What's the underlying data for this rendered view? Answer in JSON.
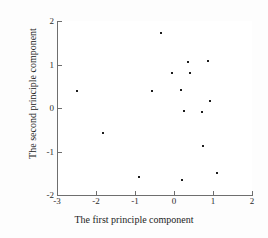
{
  "chart_data": {
    "type": "scatter",
    "title": "",
    "xlabel": "The first principle component",
    "ylabel": "The second principle component",
    "xlim": [
      -3,
      2
    ],
    "ylim": [
      -2,
      2
    ],
    "xticks": [
      "-3",
      "-2",
      "-1",
      "0",
      "1",
      "2"
    ],
    "xtick_values": [
      -3,
      -2,
      -1,
      0,
      1,
      2
    ],
    "yticks": [
      "2",
      "1",
      "0",
      "-1",
      "-2"
    ],
    "ytick_values": [
      2,
      1,
      0,
      -1,
      -2
    ],
    "grid": false,
    "legend": null,
    "marker": "dot",
    "marker_color": "#1d1d1d",
    "series": [
      {
        "name": "observations",
        "points": [
          {
            "x": -2.5,
            "y": 0.39
          },
          {
            "x": -1.82,
            "y": -0.57
          },
          {
            "x": -0.9,
            "y": -1.59
          },
          {
            "x": -0.56,
            "y": 0.39
          },
          {
            "x": -0.33,
            "y": 1.72
          },
          {
            "x": -0.05,
            "y": 0.8
          },
          {
            "x": 0.18,
            "y": 0.41
          },
          {
            "x": 0.21,
            "y": -1.66
          },
          {
            "x": 0.26,
            "y": -0.07
          },
          {
            "x": 0.36,
            "y": 1.06
          },
          {
            "x": 0.41,
            "y": 0.8
          },
          {
            "x": 0.72,
            "y": -0.09
          },
          {
            "x": 0.74,
            "y": -0.87
          },
          {
            "x": 0.87,
            "y": 1.08
          },
          {
            "x": 0.92,
            "y": 0.16
          },
          {
            "x": 1.1,
            "y": -1.49
          }
        ]
      }
    ]
  }
}
